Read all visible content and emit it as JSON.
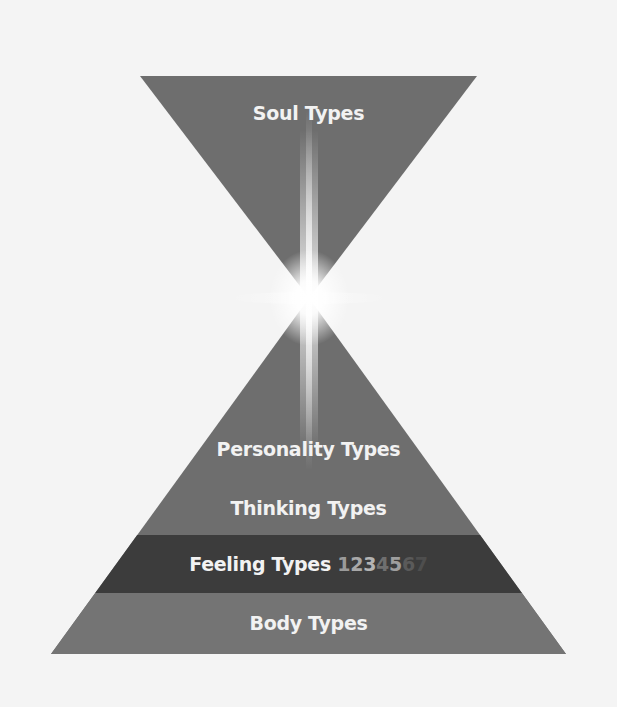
{
  "diagram": {
    "top_triangle": {
      "label": "Soul Types"
    },
    "bottom_triangle": {
      "layers": [
        {
          "label": "Personality Types"
        },
        {
          "label": "Thinking Types"
        },
        {
          "label": "Feeling Types",
          "suffix_digits": [
            "1",
            "2",
            "3",
            "4",
            "5",
            "6",
            "7"
          ]
        },
        {
          "label": "Body Types"
        }
      ]
    },
    "colors": {
      "background": "#f4f4f4",
      "triangle_fill": "#6e6e6e",
      "feeling_band": "#3c3c3c",
      "label_text": "#f2f2f2",
      "glow": "#ffffff"
    }
  }
}
